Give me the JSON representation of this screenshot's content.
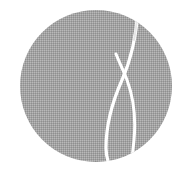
{
  "logo": {
    "shape": "circle",
    "center": [
      96,
      86
    ],
    "radius": 76,
    "fill_color": "#a3a3a3",
    "dither_light": "#b8b8b8",
    "dither_dark": "#909090",
    "stroke_color": "#ffffff",
    "mark": "crossed-curves-leaf"
  },
  "background_color": "#ffffff"
}
